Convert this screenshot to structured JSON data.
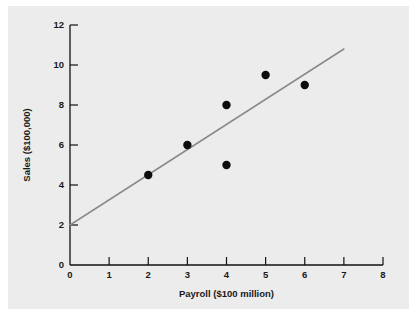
{
  "chart_data": {
    "type": "scatter",
    "title": "",
    "xlabel": "Payroll ($100 million)",
    "ylabel": "Sales ($100,000)",
    "xlim": [
      0,
      8
    ],
    "ylim": [
      0,
      12
    ],
    "xticks": [
      "0",
      "1",
      "2",
      "3",
      "4",
      "5",
      "6",
      "7",
      "8"
    ],
    "xtick_values": [
      0,
      1,
      2,
      3,
      4,
      5,
      6,
      7,
      8
    ],
    "yticks": [
      "0",
      "2",
      "4",
      "6",
      "8",
      "10",
      "12"
    ],
    "ytick_values": [
      0,
      2,
      4,
      6,
      8,
      10,
      12
    ],
    "grid": false,
    "legend": "none",
    "series": [
      {
        "name": "observations",
        "marker": "filled-circle",
        "color": "#0d0d0d",
        "points": [
          {
            "x": 2,
            "y": 4.5
          },
          {
            "x": 3,
            "y": 6.0
          },
          {
            "x": 4,
            "y": 8.0
          },
          {
            "x": 4,
            "y": 5.0
          },
          {
            "x": 5,
            "y": 9.5
          },
          {
            "x": 6,
            "y": 9.0
          }
        ]
      }
    ],
    "trend_line": {
      "name": "regression-line",
      "color": "#8a8a8a",
      "x_start": 0,
      "y_start": 2.0,
      "x_end": 7.0,
      "y_end": 10.8
    },
    "colors": {
      "background": "#ececec",
      "page": "#ffffff",
      "axis": "#111111",
      "marker": "#0d0d0d",
      "trend": "#8a8a8a",
      "text": "#1a1a1a"
    }
  }
}
